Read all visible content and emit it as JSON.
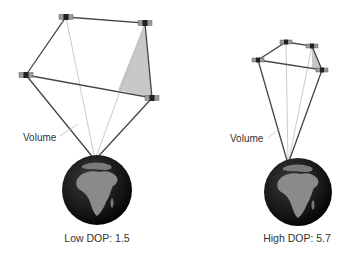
{
  "colors": {
    "background": "#ffffff",
    "line_dark": "#444444",
    "line_light": "#bbbbbb",
    "volume_fill": "#c8c8c8",
    "globe_ocean": "#1a1a1a",
    "globe_land": "#8a8a8a",
    "text": "#333333"
  },
  "diagrams": [
    {
      "id": "low",
      "volume_label": "Volume",
      "dop_label": "Low DOP: 1.5",
      "receiver": [
        95,
        160
      ],
      "satellites": [
        [
          66,
          17
        ],
        [
          145,
          23
        ],
        [
          26,
          75
        ],
        [
          152,
          98
        ]
      ],
      "globe": {
        "cx": 97,
        "cy": 190,
        "r": 35
      },
      "volume_label_pos": [
        23,
        132
      ],
      "dop_label_pos": [
        97,
        232
      ]
    },
    {
      "id": "high",
      "volume_label": "Volume",
      "dop_label": "High DOP: 5.7",
      "receiver": [
        288,
        164
      ],
      "satellites": [
        [
          286,
          42
        ],
        [
          312,
          46
        ],
        [
          258,
          60
        ],
        [
          322,
          70
        ]
      ],
      "globe": {
        "cx": 298,
        "cy": 192,
        "r": 34
      },
      "volume_label_pos": [
        230,
        133
      ],
      "dop_label_pos": [
        297,
        232
      ]
    }
  ]
}
